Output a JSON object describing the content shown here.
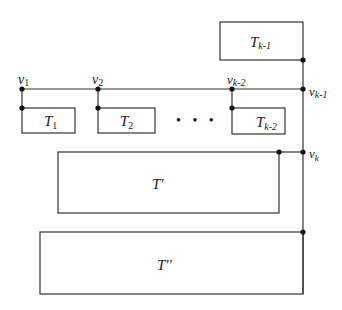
{
  "diagram": {
    "type": "tree decomposition",
    "colors": {
      "stroke": "#333333",
      "node": "#111111",
      "background": "#ffffff"
    },
    "vertices": [
      {
        "id": "v1",
        "base": "v",
        "sub": "1"
      },
      {
        "id": "v2",
        "base": "v",
        "sub": "2"
      },
      {
        "id": "vk-2",
        "base": "v",
        "sub": "k-2"
      },
      {
        "id": "vk-1",
        "base": "v",
        "sub": "k-1"
      },
      {
        "id": "vk",
        "base": "v",
        "sub": "k"
      }
    ],
    "subtrees": [
      {
        "id": "T1",
        "base": "T",
        "sub": "1"
      },
      {
        "id": "T2",
        "base": "T",
        "sub": "2"
      },
      {
        "id": "Tk-2",
        "base": "T",
        "sub": "k-2"
      },
      {
        "id": "Tk-1",
        "base": "T",
        "sub": "k-1"
      },
      {
        "id": "Tprime",
        "label": "T'"
      },
      {
        "id": "Tdoubleprime",
        "label": "T''"
      }
    ],
    "ellipsis": "• • •"
  }
}
